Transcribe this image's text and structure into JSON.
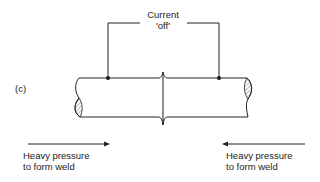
{
  "diagram": {
    "panel_label": "(c)",
    "current_label_line1": "Current",
    "current_label_line2": "'off'",
    "left_pressure": {
      "line1": "Heavy pressure",
      "line2": "to form weld",
      "direction": "right"
    },
    "right_pressure": {
      "line1": "Heavy pressure",
      "line2": "to form weld",
      "direction": "left"
    },
    "colors": {
      "line": "#222222",
      "hatch": "#888888",
      "background": "#ffffff"
    }
  }
}
